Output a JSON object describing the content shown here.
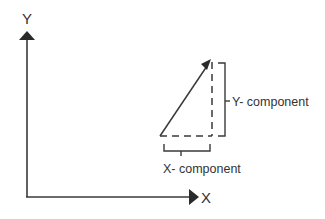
{
  "diagram": {
    "type": "vector-components",
    "axes": {
      "x_label": "X",
      "y_label": "Y"
    },
    "labels": {
      "x_component": "X- component",
      "y_component": "Y- component"
    },
    "colors": {
      "stroke": "#3a3a3a",
      "text": "#333333",
      "background": "#ffffff"
    }
  }
}
